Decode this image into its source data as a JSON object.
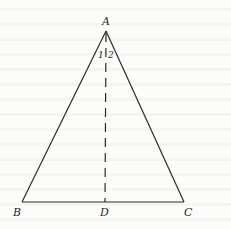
{
  "figure": {
    "type": "isosceles-triangle-with-bisector",
    "stroke_color": "#2a2a2a",
    "background_color": "#fcfcfa",
    "vertices": {
      "A": {
        "label": "A",
        "x": 106,
        "y": 31
      },
      "B": {
        "label": "B",
        "x": 22,
        "y": 202
      },
      "C": {
        "label": "C",
        "x": 184,
        "y": 202
      },
      "D": {
        "label": "D",
        "x": 105,
        "y": 202
      }
    },
    "segments": [
      {
        "from": "A",
        "to": "B",
        "style": "solid"
      },
      {
        "from": "A",
        "to": "C",
        "style": "solid"
      },
      {
        "from": "B",
        "to": "C",
        "style": "solid"
      },
      {
        "from": "A",
        "to": "D",
        "style": "dashed"
      }
    ],
    "angle_labels": [
      {
        "label": "1",
        "side": "left of AD"
      },
      {
        "label": "2",
        "side": "right of AD"
      }
    ]
  }
}
